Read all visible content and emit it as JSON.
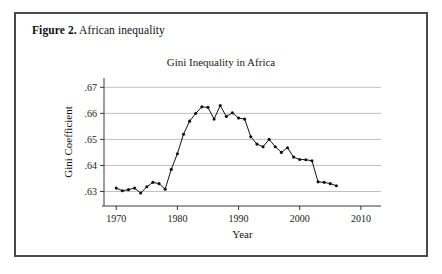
{
  "figure": {
    "caption_label": "Figure 2.",
    "caption_text": " African inequality"
  },
  "chart_data": {
    "type": "line",
    "title": "Gini Inequality in Africa",
    "xlabel": "Year",
    "ylabel": "Gini Coefficient",
    "xlim": [
      1968,
      2011
    ],
    "ylim": [
      0.6275,
      0.6705
    ],
    "xticks": [
      1970,
      1980,
      1990,
      2000,
      2010
    ],
    "xtick_labels": [
      "1970",
      "1980",
      "1990",
      "2000",
      "2010"
    ],
    "yticks": [
      0.63,
      0.64,
      0.65,
      0.66,
      0.67
    ],
    "ytick_labels": [
      ".63",
      ".64",
      ".65",
      ".66",
      ".67"
    ],
    "grid": "horizontal",
    "legend": "none",
    "marker": "filled-circle",
    "series": [
      {
        "name": "Gini Coefficient",
        "x": [
          1970,
          1971,
          1972,
          1973,
          1974,
          1975,
          1976,
          1977,
          1978,
          1979,
          1980,
          1981,
          1982,
          1983,
          1984,
          1985,
          1986,
          1987,
          1988,
          1989,
          1990,
          1991,
          1992,
          1993,
          1994,
          1995,
          1996,
          1997,
          1998,
          1999,
          2000,
          2001,
          2002,
          2003,
          2004,
          2005,
          2006
        ],
        "values": [
          0.6313,
          0.6303,
          0.6307,
          0.6313,
          0.6294,
          0.6318,
          0.6335,
          0.633,
          0.6309,
          0.6385,
          0.6445,
          0.652,
          0.657,
          0.66,
          0.6625,
          0.6623,
          0.6578,
          0.663,
          0.6588,
          0.6602,
          0.6582,
          0.6578,
          0.651,
          0.6482,
          0.6472,
          0.65,
          0.6472,
          0.645,
          0.6468,
          0.6432,
          0.6423,
          0.6422,
          0.6418,
          0.6337,
          0.6335,
          0.633,
          0.6322
        ]
      }
    ]
  }
}
